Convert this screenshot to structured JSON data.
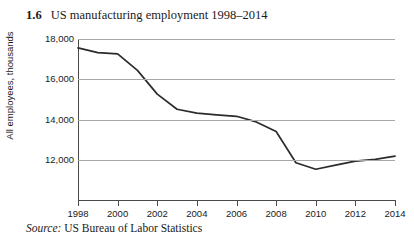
{
  "figure": {
    "number": "1.6",
    "title": "US manufacturing employment 1998–2014",
    "source_label": "Source:",
    "source_text": "US Bureau of Labor Statistics"
  },
  "chart_data": {
    "type": "line",
    "title": "US manufacturing employment 1998–2014",
    "xlabel": "",
    "ylabel": "All employees, thousands",
    "x": [
      1998,
      1999,
      2000,
      2001,
      2002,
      2003,
      2004,
      2005,
      2006,
      2007,
      2008,
      2009,
      2010,
      2011,
      2012,
      2013,
      2014
    ],
    "values": [
      17560,
      17320,
      17260,
      16440,
      15260,
      14510,
      14320,
      14230,
      14160,
      13880,
      13400,
      11850,
      11530,
      11730,
      11930,
      12020,
      12180
    ],
    "series": [
      {
        "name": "All employees, thousands",
        "values": [
          17560,
          17320,
          17260,
          16440,
          15260,
          14510,
          14320,
          14230,
          14160,
          13880,
          13400,
          11850,
          11530,
          11730,
          11930,
          12020,
          12180
        ]
      }
    ],
    "xlim": [
      1998,
      2014
    ],
    "ylim": [
      10000,
      18000
    ],
    "y_ticks": [
      12000,
      14000,
      16000,
      18000
    ],
    "y_tick_labels": [
      "12,000",
      "14,000",
      "16,000",
      "18,000"
    ],
    "x_ticks": [
      1998,
      2000,
      2002,
      2004,
      2006,
      2008,
      2010,
      2012,
      2014
    ],
    "x_tick_labels": [
      "1998",
      "2000",
      "2002",
      "2004",
      "2006",
      "2008",
      "2010",
      "2012",
      "2014"
    ],
    "grid": "horizontal",
    "legend": "none",
    "line_color": "#2b2b2b",
    "grid_color": "#a8a8a8",
    "axis_color": "#4a4a4a"
  }
}
